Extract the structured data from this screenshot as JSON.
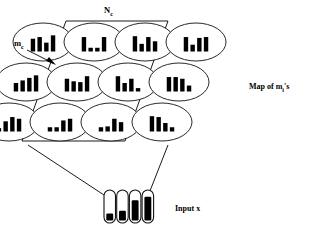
{
  "figure": {
    "background_color": "#ffffff",
    "ink_color": "#000000"
  },
  "labels": {
    "neighborhood": {
      "base": "N",
      "subscript": "c",
      "full": "N_c"
    },
    "winner": {
      "base": "m",
      "subscript": "c",
      "full": "m_c"
    },
    "map_caption": {
      "prefix": "Map of m",
      "subscript": "i",
      "suffix": "'s",
      "full": "Map of m_i's"
    },
    "input_caption": {
      "full": "Input x"
    }
  },
  "map_grid": {
    "rows": 3,
    "cols": 4,
    "cell_shape": "ellipse",
    "bars_per_cell": 4,
    "cells": [
      {
        "id": "cell-r0-c0",
        "row": 0,
        "col": 0,
        "values": [
          0.75,
          0.85,
          0.52,
          0.95
        ]
      },
      {
        "id": "cell-r0-c1",
        "row": 0,
        "col": 1,
        "values": [
          0.85,
          0.22,
          0.22,
          0.85
        ]
      },
      {
        "id": "cell-r0-c2",
        "row": 0,
        "col": 2,
        "values": [
          0.9,
          0.45,
          0.85,
          0.6
        ]
      },
      {
        "id": "cell-r0-c3",
        "row": 0,
        "col": 3,
        "values": [
          0.85,
          0.4,
          0.8,
          0.85
        ]
      },
      {
        "id": "cell-r1-c0",
        "row": 1,
        "col": 0,
        "values": [
          0.5,
          0.65,
          0.8,
          0.95
        ]
      },
      {
        "id": "cell-r1-c1",
        "row": 1,
        "col": 1,
        "values": [
          0.75,
          0.6,
          0.55,
          0.9
        ]
      },
      {
        "id": "cell-r1-c2",
        "row": 1,
        "col": 2,
        "values": [
          0.9,
          0.5,
          0.75,
          0.2
        ]
      },
      {
        "id": "cell-r1-c3",
        "row": 1,
        "col": 3,
        "values": [
          0.85,
          0.85,
          0.75,
          0.35
        ]
      },
      {
        "id": "cell-r2-c0",
        "row": 2,
        "col": 0,
        "values": [
          0.2,
          0.6,
          0.85,
          0.75
        ]
      },
      {
        "id": "cell-r2-c1",
        "row": 2,
        "col": 1,
        "values": [
          0.25,
          0.25,
          0.65,
          0.75
        ]
      },
      {
        "id": "cell-r2-c2",
        "row": 2,
        "col": 2,
        "values": [
          0.25,
          0.3,
          0.75,
          0.55
        ]
      },
      {
        "id": "cell-r2-c3",
        "row": 2,
        "col": 3,
        "values": [
          0.9,
          0.85,
          0.5,
          0.25
        ]
      }
    ]
  },
  "input_vector": {
    "component_count": 4,
    "shape": "capsule",
    "values": [
      0.25,
      0.35,
      0.72,
      0.85
    ]
  },
  "neighborhood_outline": {
    "shape": "parallelogram",
    "points": "66,21 168,21 125,141 22,141"
  },
  "connector_lines": [
    {
      "id": "left-connector",
      "x1": 28,
      "y1": 145,
      "x2": 104,
      "y2": 195
    },
    {
      "id": "right-connector",
      "x1": 168,
      "y1": 145,
      "x2": 148,
      "y2": 196
    }
  ],
  "pointer": {
    "id": "mc-pointer",
    "line": {
      "x1": 27,
      "y1": 50,
      "x2": 53,
      "y2": 63
    },
    "arrow_points": "56,65 46,61 49,57"
  }
}
